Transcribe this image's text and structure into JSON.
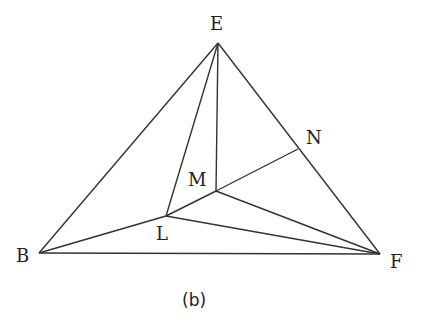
{
  "caption": "(b)",
  "points": {
    "E": {
      "label": "E",
      "x": 218,
      "y": 43
    },
    "B": {
      "label": "B",
      "x": 39,
      "y": 253
    },
    "F": {
      "label": "F",
      "x": 380,
      "y": 254
    },
    "N": {
      "label": "N",
      "x": 298,
      "y": 149
    },
    "M": {
      "label": "M",
      "x": 216,
      "y": 191
    },
    "L": {
      "label": "L",
      "x": 166,
      "y": 216
    }
  },
  "segments": [
    [
      "E",
      "B"
    ],
    [
      "E",
      "F"
    ],
    [
      "B",
      "F"
    ],
    [
      "E",
      "L"
    ],
    [
      "E",
      "M"
    ],
    [
      "B",
      "L"
    ],
    [
      "L",
      "M"
    ],
    [
      "M",
      "N"
    ],
    [
      "M",
      "F"
    ],
    [
      "L",
      "F"
    ]
  ]
}
